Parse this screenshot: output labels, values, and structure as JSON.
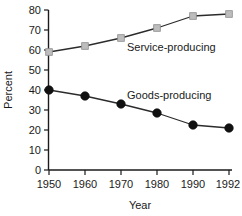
{
  "chart_data": {
    "type": "line",
    "title": "",
    "xlabel": "Year",
    "ylabel": "Percent",
    "categories": [
      "1950",
      "1960",
      "1970",
      "1980",
      "1990",
      "1992"
    ],
    "ylim": [
      0,
      80
    ],
    "yticks": [
      0,
      10,
      20,
      30,
      40,
      50,
      60,
      70,
      80
    ],
    "ytick_labels": [
      "0",
      "10",
      "20",
      "30",
      "40",
      "50",
      "60",
      "70",
      "80"
    ],
    "grid": false,
    "legend_position": "inline-annotation",
    "series": [
      {
        "name": "Service-producing",
        "marker": "square",
        "marker_color": "#bdbdbd",
        "line_color": "#2b2b2b",
        "values": [
          59,
          62,
          66,
          71,
          77,
          78
        ]
      },
      {
        "name": "Goods-producing",
        "marker": "circle",
        "marker_color": "#111111",
        "line_color": "#2b2b2b",
        "values": [
          40,
          37,
          33,
          28.5,
          22.5,
          21
        ]
      }
    ],
    "annotations": [
      {
        "text": "Service-producing",
        "x": 1975,
        "y": 64
      },
      {
        "text": "Goods-producing",
        "x": 1974,
        "y": 33
      }
    ]
  },
  "axis": {
    "y_title": "Percent",
    "x_title": "Year"
  },
  "colors": {
    "background": "#ffffff",
    "axis": "#1a1a1a",
    "line": "#2b2b2b",
    "goods_marker": "#111111",
    "service_marker": "#bdbdbd"
  }
}
